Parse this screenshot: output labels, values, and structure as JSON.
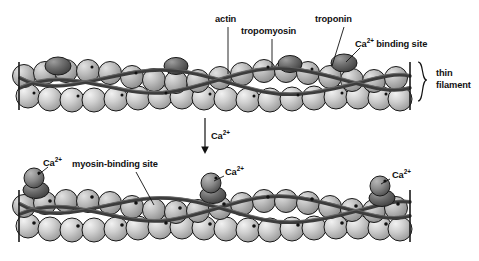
{
  "figure": {
    "background_color": "#ffffff",
    "width": 479,
    "height": 261
  },
  "colors": {
    "actin_light": "#d8d8d8",
    "actin_mid": "#b4b4b4",
    "actin_dark": "#8e8e8e",
    "troponin_dark": "#5a5a5a",
    "tropomyosin": "#4a4a4a",
    "outline": "#1a1a1a",
    "label_text": "#111111"
  },
  "panels": {
    "top": {
      "name": "relaxed-thin-filament",
      "labels": [
        {
          "id": "actin",
          "text": "actin",
          "x": 215,
          "y": 15,
          "leader": {
            "x1": 228,
            "y1": 27,
            "x2": 228,
            "y2": 74
          }
        },
        {
          "id": "tropomyosin",
          "text": "tropomyosin",
          "x": 241,
          "y": 27,
          "leader": {
            "x1": 272,
            "y1": 39,
            "x2": 272,
            "y2": 67
          }
        },
        {
          "id": "troponin",
          "text": "troponin",
          "x": 315,
          "y": 15,
          "leader": {
            "x1": 344,
            "y1": 27,
            "x2": 332,
            "y2": 66
          }
        },
        {
          "id": "ca-binding-site",
          "text": "Ca2+ binding site",
          "x": 355,
          "y": 36,
          "sup": "2+",
          "base": "Ca",
          "tail": " binding site",
          "leader": {
            "x1": 360,
            "y1": 48,
            "x2": 346,
            "y2": 62
          }
        }
      ],
      "bracket": {
        "id": "thin-filament-bracket",
        "text_line1": "thin",
        "text_line2": "filament",
        "x": 438,
        "y1": 62,
        "y2": 101
      },
      "filament": {
        "x_start": 18,
        "x_end": 412,
        "y_top": 57,
        "y_bottom": 110
      },
      "troponin_count": 3
    },
    "arrow": {
      "id": "ca-transition-arrow",
      "label": "Ca2+",
      "base": "Ca",
      "sup": "2+",
      "x": 205,
      "y1": 118,
      "y2": 152,
      "label_x": 211,
      "label_y": 128
    },
    "bottom": {
      "name": "activated-thin-filament",
      "labels": [
        {
          "id": "ca-left",
          "text": "Ca2+",
          "base": "Ca",
          "sup": "2+",
          "x": 43,
          "y": 155,
          "leader": {
            "x1": 48,
            "y1": 167,
            "x2": 38,
            "y2": 178
          }
        },
        {
          "id": "myosin-binding-site",
          "text": "myosin-binding site",
          "x": 72,
          "y": 160,
          "leader": {
            "x1": 136,
            "y1": 172,
            "x2": 154,
            "y2": 205
          }
        },
        {
          "id": "ca-middle",
          "text": "Ca2+",
          "base": "Ca",
          "sup": "2+",
          "x": 225,
          "y": 164,
          "leader": {
            "x1": 224,
            "y1": 176,
            "x2": 213,
            "y2": 184
          }
        },
        {
          "id": "ca-right",
          "text": "Ca2+",
          "base": "Ca",
          "sup": "2+",
          "x": 392,
          "y": 167,
          "leader": {
            "x1": 390,
            "y1": 179,
            "x2": 380,
            "y2": 187
          }
        }
      ],
      "filament": {
        "x_start": 18,
        "x_end": 412,
        "y_top": 185,
        "y_bottom": 243
      },
      "troponin_count": 3
    }
  },
  "legend_terms": [
    "actin",
    "tropomyosin",
    "troponin",
    "Ca2+ binding site",
    "thin filament",
    "myosin-binding site",
    "Ca2+"
  ]
}
